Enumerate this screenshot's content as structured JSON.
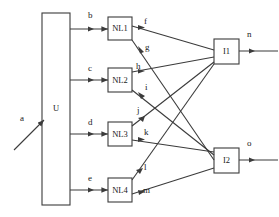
{
  "diagram": {
    "stroke_color": "#3b3b3b",
    "text_color": "#1a1a1a",
    "background": "#ffffff",
    "blocks": [
      {
        "id": "U",
        "label": "U",
        "x": 42,
        "y": 13,
        "w": 28,
        "h": 192
      },
      {
        "id": "NL1",
        "label": "NL1",
        "x": 108,
        "y": 17,
        "w": 24,
        "h": 23
      },
      {
        "id": "NL2",
        "label": "NL2",
        "x": 108,
        "y": 68,
        "w": 24,
        "h": 24
      },
      {
        "id": "NL3",
        "label": "NL3",
        "x": 108,
        "y": 122,
        "w": 24,
        "h": 24
      },
      {
        "id": "NL4",
        "label": "NL4",
        "x": 108,
        "y": 178,
        "w": 24,
        "h": 24
      },
      {
        "id": "I1",
        "label": "I1",
        "x": 214,
        "y": 39,
        "w": 25,
        "h": 25
      },
      {
        "id": "I2",
        "label": "I2",
        "x": 214,
        "y": 148,
        "w": 25,
        "h": 25
      }
    ],
    "signal_labels": [
      {
        "name": "a",
        "text": "a",
        "x": 20,
        "y": 114
      },
      {
        "name": "b",
        "text": "b",
        "x": 88,
        "y": 11
      },
      {
        "name": "c",
        "text": "c",
        "x": 88,
        "y": 64
      },
      {
        "name": "d",
        "text": "d",
        "x": 88,
        "y": 118
      },
      {
        "name": "e",
        "text": "e",
        "x": 88,
        "y": 174
      },
      {
        "name": "f",
        "text": "f",
        "x": 144,
        "y": 17
      },
      {
        "name": "g",
        "text": "g",
        "x": 145,
        "y": 43
      },
      {
        "name": "h",
        "text": "h",
        "x": 136,
        "y": 62
      },
      {
        "name": "i",
        "text": "i",
        "x": 145,
        "y": 83
      },
      {
        "name": "j",
        "text": "j",
        "x": 137,
        "y": 106
      },
      {
        "name": "k",
        "text": "k",
        "x": 144,
        "y": 128
      },
      {
        "name": "l",
        "text": "l",
        "x": 144,
        "y": 163
      },
      {
        "name": "m",
        "text": "m",
        "x": 143,
        "y": 186
      },
      {
        "name": "n",
        "text": "n",
        "x": 247,
        "y": 30
      },
      {
        "name": "o",
        "text": "o",
        "x": 247,
        "y": 139
      }
    ],
    "connections": [
      {
        "from": "a",
        "to": "U",
        "signal": "a"
      },
      {
        "from": "U",
        "to": "NL1",
        "signal": "b"
      },
      {
        "from": "U",
        "to": "NL2",
        "signal": "c"
      },
      {
        "from": "U",
        "to": "NL3",
        "signal": "d"
      },
      {
        "from": "U",
        "to": "NL4",
        "signal": "e"
      },
      {
        "from": "NL1",
        "to": "I1",
        "signal": "f"
      },
      {
        "from": "NL1",
        "to": "I2",
        "signal": "g"
      },
      {
        "from": "NL2",
        "to": "I1",
        "signal": "h"
      },
      {
        "from": "NL2",
        "to": "I2",
        "signal": "i"
      },
      {
        "from": "NL3",
        "to": "I1",
        "signal": "j"
      },
      {
        "from": "NL3",
        "to": "I2",
        "signal": "k"
      },
      {
        "from": "NL4",
        "to": "I1",
        "signal": "l"
      },
      {
        "from": "NL4",
        "to": "I2",
        "signal": "m"
      },
      {
        "from": "I1",
        "to": "out",
        "signal": "n"
      },
      {
        "from": "I2",
        "to": "out",
        "signal": "o"
      }
    ]
  }
}
